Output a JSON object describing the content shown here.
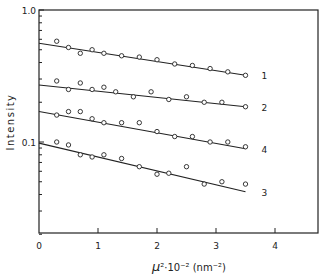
{
  "chart_data": {
    "type": "scatter",
    "title": "",
    "xlabel": "μ²·10⁻² (nm⁻²)",
    "ylabel": "Intensity",
    "yscale": "log",
    "xlim": [
      0,
      4.73
    ],
    "ylim": [
      0.0204,
      1.0
    ],
    "x_ticks": [
      0,
      1,
      2,
      3,
      4
    ],
    "y_tick_labels": [
      "1.0",
      "0.1"
    ],
    "grid": false,
    "legend": "curve labels at right end of each line",
    "series": [
      {
        "name": "1",
        "fit_line": {
          "x": [
            0,
            3.5
          ],
          "y": [
            0.56,
            0.32
          ]
        },
        "points": {
          "x": [
            0.3,
            0.5,
            0.7,
            0.9,
            1.1,
            1.4,
            1.7,
            2.0,
            2.3,
            2.6,
            2.9,
            3.2,
            3.5
          ],
          "y": [
            0.58,
            0.52,
            0.47,
            0.5,
            0.47,
            0.45,
            0.44,
            0.42,
            0.39,
            0.38,
            0.36,
            0.34,
            0.32
          ]
        }
      },
      {
        "name": "2",
        "fit_line": {
          "x": [
            0,
            3.5
          ],
          "y": [
            0.27,
            0.185
          ]
        },
        "points": {
          "x": [
            0.3,
            0.5,
            0.7,
            0.9,
            1.1,
            1.3,
            1.6,
            1.9,
            2.2,
            2.5,
            2.8,
            3.1,
            3.5
          ],
          "y": [
            0.29,
            0.25,
            0.28,
            0.25,
            0.26,
            0.24,
            0.22,
            0.24,
            0.21,
            0.22,
            0.2,
            0.2,
            0.185
          ]
        }
      },
      {
        "name": "4",
        "fit_line": {
          "x": [
            0,
            3.5
          ],
          "y": [
            0.17,
            0.089
          ]
        },
        "points": {
          "x": [
            0.3,
            0.5,
            0.7,
            0.9,
            1.1,
            1.4,
            1.7,
            2.0,
            2.3,
            2.6,
            2.9,
            3.2,
            3.5
          ],
          "y": [
            0.16,
            0.17,
            0.17,
            0.15,
            0.14,
            0.14,
            0.14,
            0.12,
            0.11,
            0.11,
            0.1,
            0.1,
            0.092
          ]
        }
      },
      {
        "name": "3",
        "fit_line": {
          "x": [
            0,
            3.5
          ],
          "y": [
            0.098,
            0.042
          ]
        },
        "points": {
          "x": [
            0.3,
            0.5,
            0.7,
            0.9,
            1.1,
            1.4,
            1.7,
            2.0,
            2.2,
            2.5,
            2.8,
            3.1,
            3.5
          ],
          "y": [
            0.1,
            0.095,
            0.08,
            0.077,
            0.08,
            0.075,
            0.065,
            0.057,
            0.058,
            0.065,
            0.048,
            0.05,
            0.048
          ]
        }
      }
    ]
  },
  "axes": {
    "ylabel": "Intensity",
    "xlabel_mu": "μ",
    "xlabel_rest": "²·10⁻² (nm⁻²)",
    "y_ticks": [
      {
        "label": "1.0"
      },
      {
        "label": "0.1"
      }
    ],
    "x_ticks": [
      {
        "label": "0"
      },
      {
        "label": "1"
      },
      {
        "label": "2"
      },
      {
        "label": "3"
      },
      {
        "label": "4"
      }
    ]
  },
  "colors": {
    "ink": "#222222",
    "background": "#ffffff"
  }
}
